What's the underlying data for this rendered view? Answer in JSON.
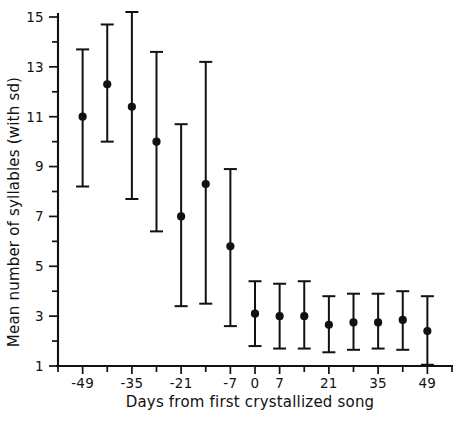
{
  "chart_data": {
    "type": "scatter",
    "title": "",
    "xlabel": "Days from first crystallized song",
    "ylabel": "Mean number of syllables (with sd)",
    "xlim": [
      -56,
      56
    ],
    "ylim": [
      1,
      15
    ],
    "grid": false,
    "legend": "none",
    "error_bars": "sd",
    "x_tick_step": 7,
    "y_tick_step": 1,
    "x_tick_values": [
      -56,
      -49,
      -42,
      -35,
      -28,
      -21,
      -14,
      -7,
      0,
      7,
      14,
      21,
      28,
      35,
      42,
      49,
      56
    ],
    "x_tick_labels": [
      "",
      "-49",
      "",
      "-35",
      "",
      "-21",
      "",
      "-7",
      "0",
      "7",
      "",
      "21",
      "",
      "35",
      "",
      "49",
      ""
    ],
    "y_tick_values": [
      1,
      2,
      3,
      4,
      5,
      6,
      7,
      8,
      9,
      10,
      11,
      12,
      13,
      14,
      15
    ],
    "y_tick_labels": [
      "1",
      "",
      "3",
      "",
      "5",
      "",
      "7",
      "",
      "9",
      "",
      "11",
      "",
      "13",
      "",
      "15"
    ],
    "x": [
      -49,
      -42,
      -35,
      -28,
      -21,
      -14,
      -7,
      0,
      7,
      14,
      21,
      28,
      35,
      42,
      49
    ],
    "points": [
      {
        "x": -49,
        "y": 11.0,
        "sd_low": 8.2,
        "sd_high": 13.7
      },
      {
        "x": -42,
        "y": 12.3,
        "sd_low": 10.0,
        "sd_high": 14.7
      },
      {
        "x": -35,
        "y": 11.4,
        "sd_low": 7.7,
        "sd_high": 15.2
      },
      {
        "x": -28,
        "y": 10.0,
        "sd_low": 6.4,
        "sd_high": 13.6
      },
      {
        "x": -21,
        "y": 7.0,
        "sd_low": 3.4,
        "sd_high": 10.7
      },
      {
        "x": -14,
        "y": 8.3,
        "sd_low": 3.5,
        "sd_high": 13.2
      },
      {
        "x": -7,
        "y": 5.8,
        "sd_low": 2.6,
        "sd_high": 8.9
      },
      {
        "x": 0,
        "y": 3.1,
        "sd_low": 1.8,
        "sd_high": 4.4
      },
      {
        "x": 7,
        "y": 3.0,
        "sd_low": 1.7,
        "sd_high": 4.3
      },
      {
        "x": 14,
        "y": 3.0,
        "sd_low": 1.7,
        "sd_high": 4.4
      },
      {
        "x": 21,
        "y": 2.65,
        "sd_low": 1.55,
        "sd_high": 3.8
      },
      {
        "x": 28,
        "y": 2.75,
        "sd_low": 1.65,
        "sd_high": 3.9
      },
      {
        "x": 35,
        "y": 2.75,
        "sd_low": 1.7,
        "sd_high": 3.9
      },
      {
        "x": 42,
        "y": 2.85,
        "sd_low": 1.65,
        "sd_high": 4.0
      },
      {
        "x": 49,
        "y": 2.4,
        "sd_low": 1.05,
        "sd_high": 3.8
      }
    ],
    "colors": {
      "marker": "#111111",
      "error_bar": "#111111",
      "axis": "#111111",
      "background": "#ffffff"
    }
  }
}
